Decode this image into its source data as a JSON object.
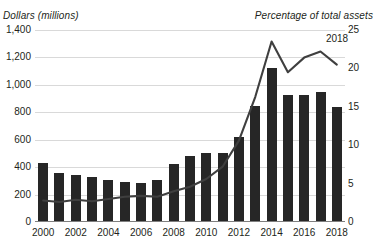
{
  "chart_data": {
    "type": "bar",
    "title": "",
    "subtitle": "",
    "xlabel": "",
    "ylabel": "Dollars (millions)",
    "y2label": "Percentage of total assets",
    "grid": true,
    "legend": "none",
    "categories": [
      "2000",
      "2001",
      "2002",
      "2003",
      "2004",
      "2005",
      "2006",
      "2007",
      "2008",
      "2009",
      "2010",
      "2011",
      "2012",
      "2013",
      "2014",
      "2015",
      "2016",
      "2017",
      "2018"
    ],
    "xtick_labels": [
      "2000",
      "2002",
      "2004",
      "2006",
      "2008",
      "2010",
      "2012",
      "2014",
      "2016",
      "2018"
    ],
    "ylim": [
      0,
      1400
    ],
    "ytick_labels": [
      "0",
      "200",
      "400",
      "600",
      "800",
      "1,000",
      "1,200",
      "1,400"
    ],
    "ytick_values": [
      0,
      200,
      400,
      600,
      800,
      1000,
      1200,
      1400
    ],
    "y2lim": [
      0,
      25
    ],
    "y2tick_labels": [
      "0",
      "5",
      "10",
      "15",
      "20",
      "25"
    ],
    "y2tick_values": [
      0,
      5,
      10,
      15,
      20,
      25
    ],
    "series": [
      {
        "name": "Dollars (millions)",
        "kind": "bar",
        "axis": "left",
        "color": "#262626",
        "values": [
          430,
          355,
          345,
          330,
          310,
          290,
          285,
          310,
          420,
          480,
          500,
          505,
          620,
          845,
          1120,
          925,
          930,
          945,
          840
        ]
      },
      {
        "name": "Percentage of total assets",
        "kind": "line",
        "axis": "right",
        "color": "#3f3f3f",
        "values": [
          2.8,
          2.6,
          2.9,
          2.7,
          3.0,
          3.3,
          3.4,
          3.3,
          4.0,
          4.6,
          5.6,
          7.2,
          10.6,
          16.3,
          23.5,
          19.5,
          21.4,
          22.2,
          20.5
        ]
      }
    ],
    "annotations": [
      {
        "name": "2018-endpoint-label",
        "text": "2018",
        "x": 337,
        "y": 33
      }
    ]
  }
}
